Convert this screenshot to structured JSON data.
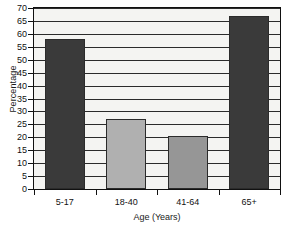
{
  "chart_data": {
    "type": "bar",
    "title": "",
    "subtitle": "",
    "xlabel": "Age (Years)",
    "ylabel": "Percentage",
    "categories": [
      "5-17",
      "18-40",
      "41-64",
      "65+"
    ],
    "values": [
      58,
      27,
      20.5,
      67
    ],
    "ylim": [
      0,
      70
    ],
    "ytick_step": 5,
    "yticks": [
      0,
      5,
      10,
      15,
      20,
      25,
      30,
      35,
      40,
      45,
      50,
      55,
      60,
      65,
      70
    ],
    "ytick_labels": [
      "0",
      "5",
      "10",
      "15",
      "20",
      "25",
      "30",
      "35",
      "40",
      "45",
      "50",
      "55",
      "60",
      "65",
      "70"
    ],
    "grid": true,
    "grid_axis": "y",
    "legend": false,
    "legend_position": "none",
    "bar_colors": [
      "#3a3a3a",
      "#b0b0b0",
      "#969696",
      "#3a3a3a"
    ],
    "bar_edge_color": "#2b2b2b",
    "plot_background": "#f4f4f2",
    "axis_color": "#111111",
    "text_color": "#111111",
    "bars": [
      {
        "category": "5-17",
        "value": 58,
        "color": "#3a3a3a"
      },
      {
        "category": "18-40",
        "value": 27,
        "color": "#b0b0b0"
      },
      {
        "category": "41-64",
        "value": 20.5,
        "color": "#969696"
      },
      {
        "category": "65+",
        "value": 67,
        "color": "#3a3a3a"
      }
    ]
  }
}
